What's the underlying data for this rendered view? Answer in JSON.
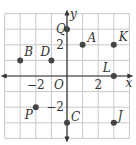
{
  "chart_data": {
    "type": "scatter",
    "title": "",
    "xlabel": "x",
    "ylabel": "y",
    "origin_label": "O",
    "xlim": [
      -4,
      4
    ],
    "ylim": [
      -4,
      4
    ],
    "grid": true,
    "tick_labels": {
      "x": [
        {
          "value": -2,
          "label": "−2"
        },
        {
          "value": 2,
          "label": "2"
        }
      ],
      "y": [
        {
          "value": 2,
          "label": "2"
        },
        {
          "value": -2,
          "label": "−2"
        }
      ]
    },
    "points": [
      {
        "label": "Q",
        "x": 0,
        "y": 3
      },
      {
        "label": "A",
        "x": 1,
        "y": 2
      },
      {
        "label": "K",
        "x": 3,
        "y": 2
      },
      {
        "label": "B",
        "x": -3,
        "y": 1
      },
      {
        "label": "D",
        "x": -1,
        "y": 1
      },
      {
        "label": "L",
        "x": 3,
        "y": 0
      },
      {
        "label": "P",
        "x": -2,
        "y": -2
      },
      {
        "label": "C",
        "x": 0,
        "y": -3
      },
      {
        "label": "J",
        "x": 3,
        "y": -3
      }
    ]
  },
  "colors": {
    "grid": "#c8c8c8",
    "axis": "#333333",
    "point": "#444444",
    "text": "#333333"
  }
}
